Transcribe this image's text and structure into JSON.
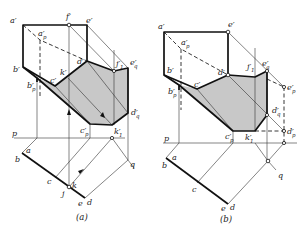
{
  "figure": {
    "colors": {
      "shadow_fill": "#c8c8c8",
      "line": "#111111",
      "background": "#ffffff"
    },
    "panels": [
      {
        "id": "a",
        "caption": "(a)",
        "labels": {
          "a_prime": "a′",
          "f_prime": "f′",
          "e_prime": "e′",
          "a_p": "a′",
          "a_p_sub": "p",
          "b_prime": "b′",
          "b_p": "b′",
          "b_p_sub": "p",
          "c_prime": "c′",
          "k_prime": "k′",
          "d_prime": "d′",
          "j_1": "j′",
          "j_1_sub": "1",
          "e_q": "e′",
          "e_q_sub": "q",
          "d_q": "d′",
          "d_q_sub": "q",
          "c_p": "c′",
          "c_p_sub": "p",
          "k_1": "k′",
          "k_1_sub": "1",
          "p": "p",
          "q": "q",
          "a": "a",
          "b": "b",
          "c": "c",
          "j": "j",
          "k": "k",
          "e": "e",
          "d": "d"
        }
      },
      {
        "id": "b",
        "caption": "(b)",
        "labels": {
          "a_prime": "a′",
          "e_prime": "e′",
          "a_p": "a′",
          "a_p_sub": "p",
          "b_prime": "b′",
          "b_p": "b′",
          "b_p_sub": "p",
          "c_prime": "c′",
          "d_prime": "d′",
          "j_1": "j′",
          "j_1_sub": "1",
          "e_q": "e′",
          "e_q_sub": "q",
          "e_p": "e′",
          "e_p_sub": "p",
          "d_q": "d′",
          "d_q_sub": "q",
          "d_p": "d′",
          "d_p_sub": "p",
          "c_p": "c′",
          "c_p_sub": "p",
          "k_1": "k′",
          "k_1_sub": "1",
          "p": "p",
          "q": "q",
          "a": "a",
          "b": "b",
          "c": "c",
          "e": "e",
          "d": "d"
        }
      }
    ]
  }
}
